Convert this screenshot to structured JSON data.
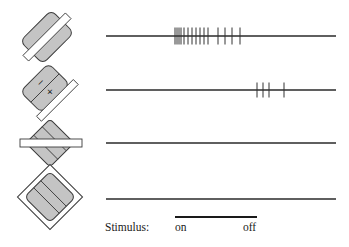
{
  "figure": {
    "colors": {
      "trace": "#2a2a2a",
      "spike": "#333333",
      "receptive_fill": "#c4c4c4",
      "bar_fill": "#ffffff",
      "outline": "#3a3a3a"
    },
    "trace_x_start": 106,
    "trace_x_end": 336,
    "rows": [
      {
        "id": "row-1",
        "stimulus_icon": "bar-along-long-axis",
        "icon_center": [
          47,
          37
        ],
        "baseline_y": 36,
        "spike_height": 17,
        "spikes_x": [
          175,
          177,
          179,
          181,
          184,
          188,
          192,
          196,
          200,
          204,
          208,
          218,
          225,
          232,
          240
        ]
      },
      {
        "id": "row-2",
        "stimulus_icon": "bar-at-edge-with-on-off-regions",
        "icon_center": [
          47,
          90
        ],
        "baseline_y": 90,
        "spike_height": 15,
        "spikes_x": [
          257,
          263,
          269,
          284
        ]
      },
      {
        "id": "row-3",
        "stimulus_icon": "bar-across-orthogonal",
        "icon_center": [
          50,
          143
        ],
        "baseline_y": 143,
        "spike_height": 0,
        "spikes_x": []
      },
      {
        "id": "row-4",
        "stimulus_icon": "diamond-frame-surround",
        "icon_center": [
          50,
          197
        ],
        "baseline_y": 199,
        "spike_height": 0,
        "spikes_x": []
      }
    ],
    "stimulus": {
      "label": "Stimulus:",
      "on_label": "on",
      "off_label": "off",
      "bar_x_start": 175,
      "bar_x_end": 257,
      "bar_y": 217
    }
  }
}
